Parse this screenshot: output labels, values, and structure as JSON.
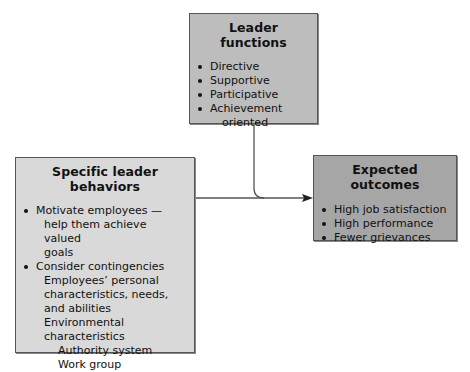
{
  "diagram": {
    "leader_functions": {
      "title": "Leader functions",
      "items": [
        "Directive",
        "Supportive",
        "Participative",
        "Achievement",
        "oriented"
      ]
    },
    "specific_behaviors": {
      "title": "Specific leader behaviors",
      "items": [
        {
          "text": "Motivate employees —",
          "cont": [
            "help them achieve valued",
            "goals"
          ]
        },
        {
          "text": "Consider contingencies"
        }
      ],
      "subitems": [
        "Employees’ personal",
        "characteristics, needs,",
        "and abilities",
        "Environmental",
        "characteristics"
      ],
      "subsubitems": [
        "Authority system",
        "Work group"
      ]
    },
    "expected_outcomes": {
      "title": "Expected outcomes",
      "items": [
        "High job satisfaction",
        "High performance",
        "Fewer grievances"
      ]
    },
    "colors": {
      "top_box": "#bdbdbd",
      "left_box": "#d9d9d9",
      "right_box": "#a6a6a6",
      "line": "#555555"
    }
  }
}
